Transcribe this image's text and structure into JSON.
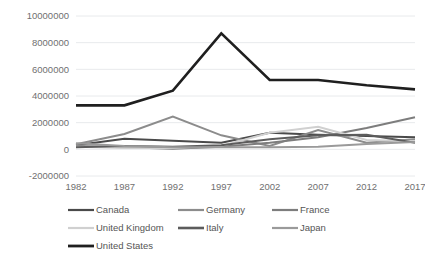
{
  "chart_data": {
    "type": "line",
    "title": "",
    "subtitle": "",
    "xlabel": "",
    "ylabel": "",
    "x": [
      1982,
      1987,
      1992,
      1997,
      2002,
      2007,
      2012,
      2017
    ],
    "xtick_labels": [
      "1982",
      "1987",
      "1992",
      "1997",
      "2002",
      "2007",
      "2012",
      "2017"
    ],
    "ytick_labels": [
      "10000000",
      "8000000",
      "6000000",
      "4000000",
      "2000000",
      "0",
      "-2000000"
    ],
    "ytick_values": [
      10000000,
      8000000,
      6000000,
      4000000,
      2000000,
      0,
      -2000000
    ],
    "ylim": [
      -2000000,
      10000000
    ],
    "xlim": [
      1982,
      2017
    ],
    "grid": true,
    "legend_position": "bottom",
    "series": [
      {
        "name": "Canada",
        "color": "#4a4a4a",
        "width": 2.0,
        "values": [
          300000,
          800000,
          650000,
          500000,
          1250000,
          1100000,
          1000000,
          900000
        ]
      },
      {
        "name": "Germany",
        "color": "#8c8c8c",
        "width": 2.0,
        "values": [
          380000,
          1150000,
          2450000,
          1050000,
          250000,
          1450000,
          500000,
          750000
        ]
      },
      {
        "name": "France",
        "color": "#7d7d7d",
        "width": 2.0,
        "values": [
          250000,
          150000,
          50000,
          200000,
          500000,
          900000,
          1600000,
          2400000
        ]
      },
      {
        "name": "United Kingdom",
        "color": "#d0d0d0",
        "width": 2.0,
        "values": [
          200000,
          100000,
          100000,
          250000,
          1250000,
          1700000,
          700000,
          600000
        ]
      },
      {
        "name": "Italy",
        "color": "#5c5c5c",
        "width": 2.0,
        "values": [
          150000,
          250000,
          200000,
          300000,
          750000,
          1050000,
          1100000,
          500000
        ]
      },
      {
        "name": "Japan",
        "color": "#9a9a9a",
        "width": 2.0,
        "values": [
          450000,
          250000,
          150000,
          150000,
          150000,
          200000,
          400000,
          550000
        ]
      },
      {
        "name": "United States",
        "color": "#1f1f1f",
        "width": 2.6,
        "values": [
          3300000,
          3300000,
          4400000,
          8700000,
          5200000,
          5200000,
          4800000,
          4500000
        ]
      }
    ]
  },
  "legend": {
    "items": [
      {
        "label": "Canada",
        "color": "#4a4a4a",
        "width": 2.2
      },
      {
        "label": "Germany",
        "color": "#8c8c8c",
        "width": 2.2
      },
      {
        "label": "France",
        "color": "#7d7d7d",
        "width": 2.2
      },
      {
        "label": "United Kingdom",
        "color": "#d0d0d0",
        "width": 2.2
      },
      {
        "label": "Italy",
        "color": "#5c5c5c",
        "width": 2.6
      },
      {
        "label": "Japan",
        "color": "#9a9a9a",
        "width": 2.2
      },
      {
        "label": "United States",
        "color": "#1f1f1f",
        "width": 2.8
      }
    ],
    "positions": [
      {
        "x": 68,
        "y": 210
      },
      {
        "x": 178,
        "y": 210
      },
      {
        "x": 272,
        "y": 210
      },
      {
        "x": 68,
        "y": 228
      },
      {
        "x": 178,
        "y": 228
      },
      {
        "x": 272,
        "y": 228
      },
      {
        "x": 68,
        "y": 246
      }
    ]
  },
  "plot_area": {
    "left": 76,
    "top": 16,
    "right": 415,
    "bottom": 176,
    "grid_color": "#e8eaec",
    "background": "#ffffff"
  }
}
